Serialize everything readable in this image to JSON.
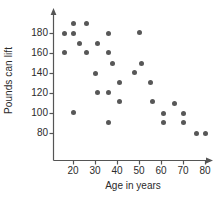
{
  "chart_data": {
    "type": "scatter",
    "title": "",
    "xlabel": "Age in years",
    "ylabel": "Pounds can lift",
    "xlim": [
      12,
      85
    ],
    "ylim": [
      72,
      196
    ],
    "grid": false,
    "legend": null,
    "xticks": [
      20,
      30,
      40,
      50,
      60,
      70,
      80
    ],
    "yticks": [
      80,
      100,
      120,
      140,
      160,
      180
    ],
    "marker_color": "#575757",
    "axis_color": "#555555",
    "points": [
      {
        "x": 16,
        "y": 180
      },
      {
        "x": 16,
        "y": 161
      },
      {
        "x": 20,
        "y": 190
      },
      {
        "x": 20,
        "y": 180
      },
      {
        "x": 20,
        "y": 101
      },
      {
        "x": 23,
        "y": 170
      },
      {
        "x": 26,
        "y": 190
      },
      {
        "x": 26,
        "y": 161
      },
      {
        "x": 30,
        "y": 140
      },
      {
        "x": 31,
        "y": 170
      },
      {
        "x": 31,
        "y": 121
      },
      {
        "x": 36,
        "y": 180
      },
      {
        "x": 36,
        "y": 161
      },
      {
        "x": 36,
        "y": 121
      },
      {
        "x": 36,
        "y": 91
      },
      {
        "x": 38,
        "y": 150
      },
      {
        "x": 41,
        "y": 131
      },
      {
        "x": 41,
        "y": 112
      },
      {
        "x": 48,
        "y": 141
      },
      {
        "x": 50,
        "y": 181
      },
      {
        "x": 51,
        "y": 150
      },
      {
        "x": 55,
        "y": 131
      },
      {
        "x": 56,
        "y": 112
      },
      {
        "x": 61,
        "y": 100
      },
      {
        "x": 61,
        "y": 91
      },
      {
        "x": 66,
        "y": 110
      },
      {
        "x": 70,
        "y": 100
      },
      {
        "x": 70,
        "y": 91
      },
      {
        "x": 76,
        "y": 80
      },
      {
        "x": 80,
        "y": 80
      }
    ]
  },
  "axis": {
    "x_title": "Age in years",
    "y_title": "Pounds can lift",
    "x_tick_labels": [
      "20",
      "30",
      "40",
      "50",
      "60",
      "70",
      "80"
    ],
    "y_tick_labels": [
      "180",
      "160",
      "140",
      "120",
      "100",
      "80"
    ]
  }
}
